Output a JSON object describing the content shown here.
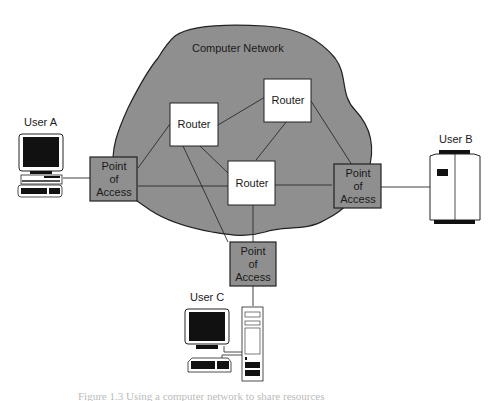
{
  "network": {
    "title": "Computer Network",
    "cloud_color": "#8f8f8f",
    "routers": [
      {
        "id": "router-1",
        "label": "Router"
      },
      {
        "id": "router-2",
        "label": "Router"
      },
      {
        "id": "router-3",
        "label": "Router"
      }
    ],
    "access_points": [
      {
        "id": "poa-a",
        "lines": [
          "Point",
          "of",
          "Access"
        ]
      },
      {
        "id": "poa-b",
        "lines": [
          "Point",
          "of",
          "Access"
        ]
      },
      {
        "id": "poa-c",
        "lines": [
          "Point",
          "of",
          "Access"
        ]
      }
    ]
  },
  "users": {
    "a": {
      "label": "User A",
      "device": "desktop-computer"
    },
    "b": {
      "label": "User B",
      "device": "mainframe-server"
    },
    "c": {
      "label": "User C",
      "device": "tower-workstation"
    }
  },
  "caption": "Figure 1.3  Using a computer network to share resources"
}
